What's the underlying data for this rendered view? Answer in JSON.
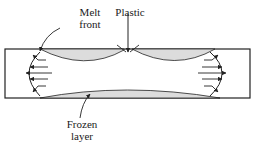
{
  "labels": {
    "melt_front_line1": "Melt",
    "melt_front_line2": "front",
    "plastic": "Plastic",
    "frozen_line1": "Frozen",
    "frozen_line2": "layer"
  },
  "colors": {
    "line": "#222222",
    "frozen": "#dcdcdc",
    "background": "#ffffff"
  }
}
